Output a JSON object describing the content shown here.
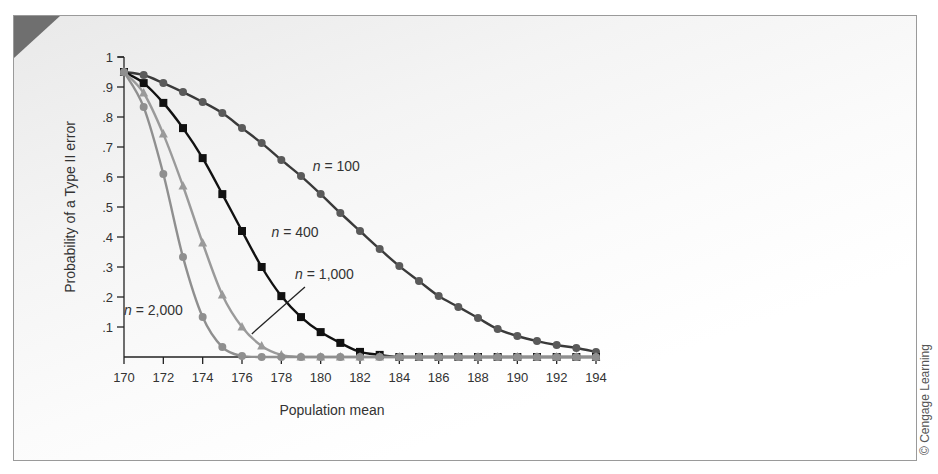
{
  "credit": "© Cengage Learning",
  "chart_data": {
    "type": "line",
    "title": "",
    "xlabel": "Population mean",
    "ylabel": "Probability of a Type II error",
    "xlim": [
      170,
      194
    ],
    "ylim": [
      0,
      1
    ],
    "x_ticks": [
      170,
      172,
      174,
      176,
      178,
      180,
      182,
      184,
      186,
      188,
      190,
      192,
      194
    ],
    "y_ticks": [
      0.1,
      0.2,
      0.3,
      0.4,
      0.5,
      0.6,
      0.7,
      0.8,
      0.9,
      1
    ],
    "y_tick_labels": [
      ".1",
      ".2",
      ".3",
      ".4",
      ".5",
      ".6",
      ".7",
      ".8",
      ".9",
      "1"
    ],
    "grid": false,
    "legend": "inline labels",
    "x": [
      170,
      171,
      172,
      173,
      174,
      175,
      176,
      177,
      178,
      179,
      180,
      181,
      182,
      183,
      184,
      185,
      186,
      187,
      188,
      189,
      190,
      191,
      192,
      193,
      194
    ],
    "series": [
      {
        "name": "n = 100",
        "label_italic": "n",
        "label_rest": " = 100",
        "marker": "circle",
        "line_color": "#3a3a3a",
        "marker_color": "#5a5a5a",
        "values": [
          0.95,
          0.94,
          0.913,
          0.883,
          0.85,
          0.813,
          0.763,
          0.713,
          0.657,
          0.603,
          0.543,
          0.48,
          0.42,
          0.36,
          0.303,
          0.253,
          0.203,
          0.167,
          0.13,
          0.093,
          0.07,
          0.053,
          0.04,
          0.03,
          0.017
        ]
      },
      {
        "name": "n = 400",
        "label_italic": "n",
        "label_rest": " = 400",
        "marker": "square",
        "line_color": "#111111",
        "marker_color": "#111111",
        "values": [
          0.95,
          0.913,
          0.847,
          0.763,
          0.663,
          0.543,
          0.42,
          0.3,
          0.203,
          0.133,
          0.083,
          0.047,
          0.017,
          0.007,
          0,
          0,
          0,
          0,
          0,
          0,
          0,
          0,
          0,
          0,
          0
        ]
      },
      {
        "name": "n = 1,000",
        "label_italic": "n",
        "label_rest": " = 1,000",
        "marker": "triangle",
        "line_color": "#9a9a9a",
        "marker_color": "#9a9a9a",
        "values": [
          0.95,
          0.88,
          0.743,
          0.57,
          0.38,
          0.207,
          0.1,
          0.037,
          0.007,
          0,
          0,
          0,
          0,
          0,
          0,
          0,
          0,
          0,
          0,
          0,
          0,
          0,
          0,
          0,
          0
        ]
      },
      {
        "name": "n = 2,000",
        "label_italic": "n",
        "label_rest": " = 2,000",
        "marker": "circle",
        "line_color": "#8f8f8f",
        "marker_color": "#8f8f8f",
        "values": [
          0.95,
          0.833,
          0.61,
          0.333,
          0.133,
          0.033,
          0.003,
          0,
          0,
          0,
          0,
          0,
          0,
          0,
          0,
          0,
          0,
          0,
          0,
          0,
          0,
          0,
          0,
          0,
          0
        ]
      }
    ],
    "annotations": [
      {
        "series": "n = 100",
        "x": 179.6,
        "y": 0.62
      },
      {
        "series": "n = 400",
        "x": 177.5,
        "y": 0.4
      },
      {
        "series": "n = 1,000",
        "x": 178.7,
        "y": 0.26,
        "pointer": [
          [
            176.5,
            0.077
          ],
          [
            179.2,
            0.233
          ]
        ]
      },
      {
        "series": "n = 2,000",
        "x": 170.0,
        "y": 0.14
      }
    ]
  }
}
